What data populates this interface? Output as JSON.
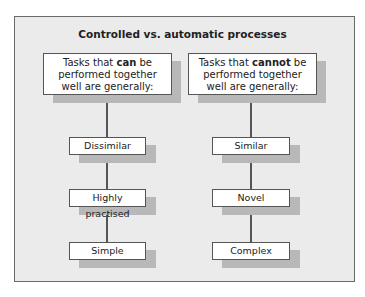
{
  "title": "Controlled vs. automatic processes",
  "columns": [
    {
      "header": {
        "line1_pre": "Tasks that ",
        "line1_bold": "can",
        "line1_post": " be",
        "line2": "performed together",
        "line3": "well are generally:"
      },
      "items": [
        "Dissimilar",
        "Highly practised",
        "Simple"
      ]
    },
    {
      "header": {
        "line1_pre": "Tasks that ",
        "line1_bold": "cannot",
        "line1_post": " be",
        "line2": "performed together",
        "line3": "well are generally:"
      },
      "items": [
        "Similar",
        "Novel",
        "Complex"
      ]
    }
  ],
  "colors": {
    "frame_bg": "#ebebeb",
    "border": "#6a6a6a",
    "shadow": "#b8b8b8",
    "connector": "#555555"
  }
}
